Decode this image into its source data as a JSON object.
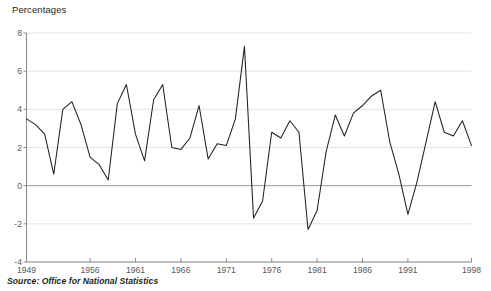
{
  "chart_data": {
    "type": "line",
    "title": "",
    "ylabel": "Percentages",
    "xlabel": "",
    "source": "Source: Office for National Statistics",
    "grid": true,
    "legend": "none",
    "line_color": "#231f20",
    "axis_color": "#8c8c8c",
    "grid_color": "#d9d9d9",
    "text_color": "#58595b",
    "ylim": [
      -4,
      8
    ],
    "yticks": [
      -4,
      -2,
      0,
      2,
      4,
      6,
      8
    ],
    "ytick_labels": [
      "-4",
      "-2",
      "0",
      "2",
      "4",
      "6",
      "8"
    ],
    "xlim": [
      1949,
      1998
    ],
    "xticks": [
      1949,
      1956,
      1961,
      1966,
      1971,
      1976,
      1981,
      1986,
      1991,
      1998
    ],
    "xtick_labels": [
      "1949",
      "1956",
      "1961",
      "1966",
      "1971",
      "1976",
      "1981",
      "1986",
      "1991",
      "1998"
    ],
    "x": [
      1949,
      1950,
      1951,
      1952,
      1953,
      1954,
      1955,
      1956,
      1957,
      1958,
      1959,
      1960,
      1961,
      1962,
      1963,
      1964,
      1965,
      1966,
      1967,
      1968,
      1969,
      1970,
      1971,
      1972,
      1973,
      1974,
      1975,
      1976,
      1977,
      1978,
      1979,
      1980,
      1981,
      1982,
      1983,
      1984,
      1985,
      1986,
      1987,
      1988,
      1989,
      1990,
      1991,
      1992,
      1993,
      1994,
      1995,
      1996,
      1997,
      1998
    ],
    "values": [
      3.5,
      3.2,
      2.7,
      0.6,
      4.0,
      4.4,
      3.2,
      1.5,
      1.1,
      0.3,
      4.3,
      5.3,
      2.7,
      1.3,
      4.5,
      5.3,
      2.0,
      1.9,
      2.5,
      4.2,
      1.4,
      2.2,
      2.1,
      3.5,
      7.3,
      -1.7,
      -0.8,
      2.8,
      2.5,
      3.4,
      2.8,
      -2.3,
      -1.3,
      1.8,
      3.7,
      2.6,
      3.8,
      4.2,
      4.7,
      5.0,
      2.3,
      0.6,
      -1.5,
      0.2,
      2.3,
      4.4,
      2.8,
      2.6,
      3.4,
      2.1
    ],
    "n_points": 50
  },
  "axes": {
    "y_title": "Percentages"
  }
}
